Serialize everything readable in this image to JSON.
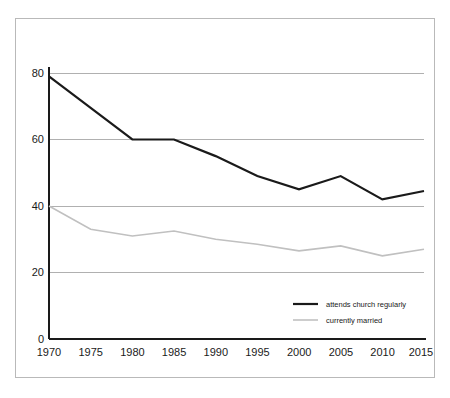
{
  "chart_data": {
    "type": "line",
    "title": "",
    "subtitle": "",
    "xlabel": "",
    "ylabel": "",
    "x": [
      1970,
      1975,
      1980,
      1985,
      1990,
      1995,
      2000,
      2005,
      2010,
      2015
    ],
    "categories": [
      "1970",
      "1975",
      "1980",
      "1985",
      "1990",
      "1995",
      "2000",
      "2005",
      "2010",
      "2015"
    ],
    "series": [
      {
        "name": "attends church regularly",
        "color": "#1a1a1a",
        "linewidth": 2.2,
        "values": [
          79,
          69.5,
          60,
          60,
          55,
          49,
          45,
          49,
          42,
          44.5
        ]
      },
      {
        "name": "currently married",
        "color": "#c0c0c0",
        "linewidth": 1.6,
        "values": [
          40,
          33,
          31,
          32.5,
          30,
          28.5,
          26.5,
          28,
          25,
          27
        ]
      }
    ],
    "xlim": [
      1970,
      2015
    ],
    "ylim": [
      0,
      82
    ],
    "yticks": [
      0,
      20,
      40,
      60,
      80
    ],
    "ytick_labels": [
      "0",
      "20",
      "40",
      "60",
      "80"
    ],
    "xticks": [
      1970,
      1975,
      1980,
      1985,
      1990,
      1995,
      2000,
      2005,
      2010,
      2015
    ],
    "grid": true,
    "grid_axis": "y",
    "grid_color": "#b0b0b0",
    "legend_position": "lower right",
    "axis_color": "#1a1a1a",
    "frame_color": "#b9b9b9",
    "background": "#ffffff"
  },
  "legend": {
    "entries": [
      {
        "label": "attends church regularly",
        "color": "#1a1a1a"
      },
      {
        "label": "currently married",
        "color": "#c0c0c0"
      }
    ]
  },
  "axes": {
    "y_tick_0": "0",
    "y_tick_1": "20",
    "y_tick_2": "40",
    "y_tick_3": "60",
    "y_tick_4": "80",
    "x_tick_0": "1970",
    "x_tick_1": "1975",
    "x_tick_2": "1980",
    "x_tick_3": "1985",
    "x_tick_4": "1990",
    "x_tick_5": "1995",
    "x_tick_6": "2000",
    "x_tick_7": "2005",
    "x_tick_8": "2010",
    "x_tick_9": "2015"
  }
}
